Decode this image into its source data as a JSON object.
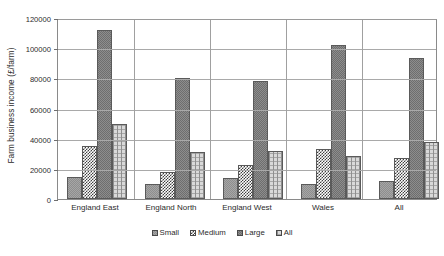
{
  "chart_data": {
    "type": "bar",
    "title": "",
    "xlabel": "",
    "ylabel": "Farm business income (£/farm)",
    "categories": [
      "England East",
      "England North",
      "England West",
      "Wales",
      "All"
    ],
    "series": [
      {
        "name": "Small",
        "values": [
          14500,
          10000,
          14000,
          10000,
          12000
        ]
      },
      {
        "name": "Medium",
        "values": [
          35000,
          18000,
          22500,
          33000,
          27000
        ]
      },
      {
        "name": "Large",
        "values": [
          112000,
          80000,
          78500,
          102000,
          93500
        ]
      },
      {
        "name": "All",
        "values": [
          50000,
          31000,
          32000,
          28500,
          37500
        ]
      }
    ],
    "ylim": [
      0,
      120000
    ],
    "yticks": [
      0,
      20000,
      40000,
      60000,
      80000,
      100000,
      120000
    ],
    "ytick_labels": [
      "0",
      "20000",
      "40000",
      "60000",
      "80000",
      "100000",
      "120000"
    ],
    "grid": true,
    "legend_position": "bottom",
    "legend": [
      "Small",
      "Medium",
      "Large",
      "All"
    ]
  }
}
